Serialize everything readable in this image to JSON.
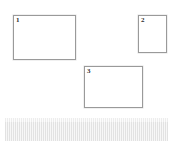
{
  "page": {
    "background_color": "#ffffff",
    "width": 179,
    "height": 141
  },
  "regions": [
    {
      "id": "box-1",
      "label": "1",
      "orientation": "landscape",
      "x": 13,
      "y": 15,
      "width": 63,
      "height": 45,
      "border_color": "#9a9a9a",
      "fill_color": "#ffffff"
    },
    {
      "id": "box-2",
      "label": "2",
      "orientation": "portrait",
      "x": 138,
      "y": 15,
      "width": 29,
      "height": 38,
      "border_color": "#9a9a9a",
      "fill_color": "#ffffff"
    },
    {
      "id": "box-3",
      "label": "3",
      "orientation": "landscape",
      "x": 84,
      "y": 66,
      "width": 59,
      "height": 42,
      "border_color": "#9a9a9a",
      "fill_color": "#ffffff"
    }
  ],
  "striped_bar": {
    "x": 5,
    "y": 118,
    "width": 163,
    "height": 23,
    "stripe_dark_color": "#e2e2e2",
    "stripe_light_color": "#f7f7f7",
    "stripe_period_px": 2
  }
}
